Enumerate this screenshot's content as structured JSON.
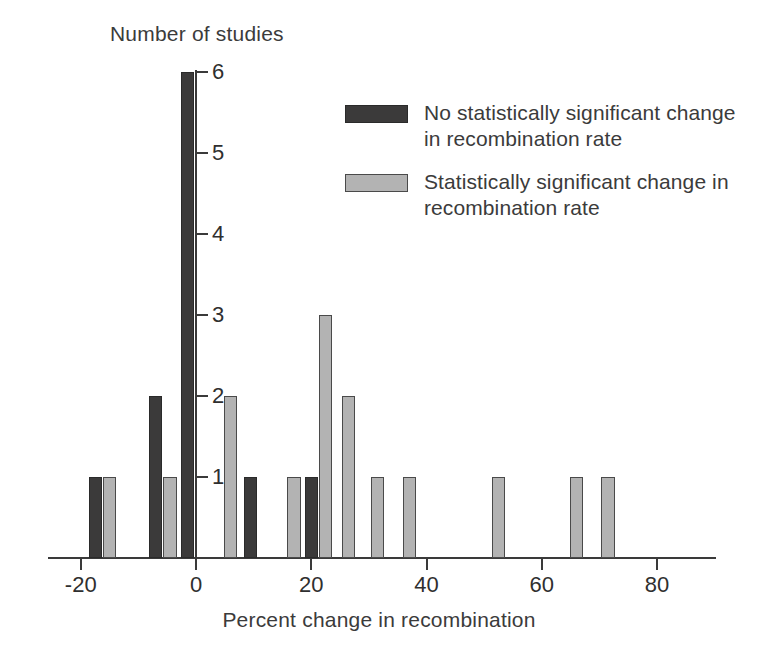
{
  "chart_data": {
    "type": "bar",
    "title": "",
    "xlabel": "Percent change in recombination",
    "ylabel": "Number of studies",
    "xlim": [
      -26,
      90
    ],
    "ylim": [
      0,
      6
    ],
    "grid": false,
    "legend_position": "upper-right",
    "bar_width_units": 2.3,
    "xticks": [
      -20,
      0,
      20,
      40,
      60,
      80
    ],
    "xtick_labels": [
      "-20",
      "0",
      "20",
      "40",
      "60",
      "80"
    ],
    "yticks": [
      1,
      2,
      3,
      4,
      5,
      6
    ],
    "ytick_labels": [
      "1",
      "2",
      "3",
      "4",
      "5",
      "6"
    ],
    "series": [
      {
        "name": "No statistically significant change in recombination rate",
        "color": "#3b3a3a",
        "points": [
          {
            "x": -17.5,
            "y": 1
          },
          {
            "x": -7.0,
            "y": 2
          },
          {
            "x": -1.5,
            "y": 6
          },
          {
            "x": 9.5,
            "y": 1
          },
          {
            "x": 20.0,
            "y": 1
          }
        ]
      },
      {
        "name": "Statistically significant change in recombination rate",
        "color": "#b3b3b3",
        "points": [
          {
            "x": -15.0,
            "y": 1
          },
          {
            "x": -4.5,
            "y": 1
          },
          {
            "x": 6.0,
            "y": 2
          },
          {
            "x": 17.0,
            "y": 1
          },
          {
            "x": 22.5,
            "y": 3
          },
          {
            "x": 26.5,
            "y": 2
          },
          {
            "x": 31.5,
            "y": 1
          },
          {
            "x": 37.0,
            "y": 1
          },
          {
            "x": 52.5,
            "y": 1
          },
          {
            "x": 66.0,
            "y": 1
          },
          {
            "x": 71.5,
            "y": 1
          }
        ]
      }
    ]
  },
  "legend": {
    "items": [
      {
        "swatch": "dark",
        "label": "No statistically significant change in recombination rate"
      },
      {
        "swatch": "light",
        "label": "Statistically significant change in recombination rate"
      }
    ]
  }
}
